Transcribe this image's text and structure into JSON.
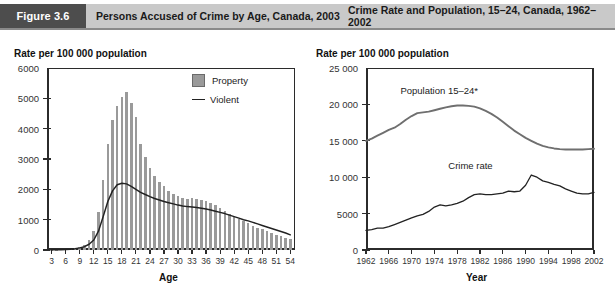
{
  "header": {
    "badge": "Figure 3.6",
    "title_left": "Persons Accused of Crime by Age, Canada, 2003",
    "title_right": "Crime Rate and Population, 15–24, Canada, 1962–2002"
  },
  "colors": {
    "bar_fill": "#9a9a9a",
    "line_stroke": "#222222",
    "population_stroke": "#6f6f6f",
    "header_bar": "#c9c9c9",
    "header_badge": "#4d4d4d",
    "axis": "#2b2b2b"
  },
  "chart_data": [
    {
      "type": "bar",
      "id": "accused-by-age",
      "title": "Persons Accused of Crime by Age, Canada, 2003",
      "ylabel": "Rate per 100 000 population",
      "xlabel": "Age",
      "ylim": [
        0,
        6000
      ],
      "yticks": [
        "0",
        "1000",
        "2000",
        "3000",
        "4000",
        "5000",
        "6000"
      ],
      "ytick_values": [
        0,
        1000,
        2000,
        3000,
        4000,
        5000,
        6000
      ],
      "xlim": [
        2,
        55
      ],
      "xticks": [
        "3",
        "6",
        "9",
        "12",
        "15",
        "18",
        "21",
        "24",
        "27",
        "30",
        "33",
        "36",
        "39",
        "42",
        "45",
        "48",
        "51",
        "54"
      ],
      "xtick_values": [
        3,
        6,
        9,
        12,
        15,
        18,
        21,
        24,
        27,
        30,
        33,
        36,
        39,
        42,
        45,
        48,
        51,
        54
      ],
      "grid": false,
      "legend_position": "top-right",
      "legend": [
        "Property",
        "Violent"
      ],
      "categories": [
        3,
        4,
        5,
        6,
        7,
        8,
        9,
        10,
        11,
        12,
        13,
        14,
        15,
        16,
        17,
        18,
        19,
        20,
        21,
        22,
        23,
        24,
        25,
        26,
        27,
        28,
        29,
        30,
        31,
        32,
        33,
        34,
        35,
        36,
        37,
        38,
        39,
        40,
        41,
        42,
        43,
        44,
        45,
        46,
        47,
        48,
        49,
        50,
        51,
        52,
        53,
        54
      ],
      "series": [
        {
          "name": "Property",
          "kind": "bar",
          "values": [
            10,
            15,
            20,
            30,
            45,
            70,
            110,
            180,
            320,
            620,
            1250,
            2300,
            3500,
            4300,
            4750,
            5050,
            5200,
            4850,
            4400,
            3500,
            3050,
            2700,
            2450,
            2250,
            2100,
            1950,
            1850,
            1780,
            1720,
            1680,
            1700,
            1680,
            1650,
            1620,
            1560,
            1480,
            1400,
            1300,
            1200,
            1100,
            1020,
            950,
            880,
            800,
            740,
            680,
            620,
            560,
            500,
            450,
            400,
            350
          ]
        },
        {
          "name": "Violent",
          "kind": "line",
          "values": [
            5,
            8,
            12,
            18,
            28,
            45,
            70,
            110,
            190,
            330,
            620,
            1100,
            1600,
            1950,
            2150,
            2200,
            2180,
            2100,
            2000,
            1900,
            1830,
            1760,
            1700,
            1650,
            1600,
            1560,
            1520,
            1480,
            1450,
            1430,
            1420,
            1400,
            1380,
            1350,
            1320,
            1280,
            1240,
            1200,
            1150,
            1100,
            1050,
            1000,
            960,
            910,
            860,
            810,
            760,
            710,
            660,
            610,
            560,
            500
          ]
        }
      ]
    },
    {
      "type": "line",
      "id": "crime-rate-and-population",
      "title": "Crime Rate and Population, 15–24, Canada, 1962–2002",
      "ylabel": "Rate per 100 000 population",
      "xlabel": "Year",
      "ylim": [
        0,
        25000
      ],
      "yticks": [
        "0",
        "5000",
        "10 000",
        "15 000",
        "20 000",
        "25 000"
      ],
      "ytick_values": [
        0,
        5000,
        10000,
        15000,
        20000,
        25000
      ],
      "xlim": [
        1962,
        2002
      ],
      "xticks": [
        "1962",
        "1966",
        "1970",
        "1974",
        "1978",
        "1982",
        "1986",
        "1990",
        "1994",
        "1998",
        "2002"
      ],
      "xtick_values": [
        1962,
        1966,
        1970,
        1974,
        1978,
        1982,
        1986,
        1990,
        1994,
        1998,
        2002
      ],
      "grid": false,
      "annotations": [
        {
          "text": "Population 15–24*",
          "x": 1974,
          "y": 21800
        },
        {
          "text": "Crime rate",
          "x": 1981,
          "y": 11600
        }
      ],
      "x": [
        1962,
        1963,
        1964,
        1965,
        1966,
        1967,
        1968,
        1969,
        1970,
        1971,
        1972,
        1973,
        1974,
        1975,
        1976,
        1977,
        1978,
        1979,
        1980,
        1981,
        1982,
        1983,
        1984,
        1985,
        1986,
        1987,
        1988,
        1989,
        1990,
        1991,
        1992,
        1993,
        1994,
        1995,
        1996,
        1997,
        1998,
        1999,
        2000,
        2001,
        2002
      ],
      "series": [
        {
          "name": "Population 15–24*",
          "values": [
            15000,
            15300,
            15700,
            16100,
            16500,
            16800,
            17300,
            17900,
            18400,
            18800,
            18900,
            19000,
            19200,
            19400,
            19600,
            19750,
            19850,
            19850,
            19800,
            19700,
            19450,
            19100,
            18700,
            18200,
            17600,
            17000,
            16400,
            15900,
            15400,
            15000,
            14600,
            14300,
            14100,
            13950,
            13850,
            13800,
            13800,
            13800,
            13800,
            13850,
            13900
          ]
        },
        {
          "name": "Crime rate",
          "values": [
            2700,
            2800,
            3000,
            3000,
            3200,
            3500,
            3800,
            4100,
            4400,
            4700,
            4900,
            5300,
            5900,
            6200,
            6050,
            6200,
            6400,
            6700,
            7200,
            7600,
            7700,
            7600,
            7600,
            7700,
            7800,
            8100,
            8000,
            8100,
            8900,
            10300,
            10000,
            9500,
            9300,
            9000,
            8800,
            8400,
            8100,
            7800,
            7700,
            7700,
            7900
          ]
        }
      ]
    }
  ]
}
